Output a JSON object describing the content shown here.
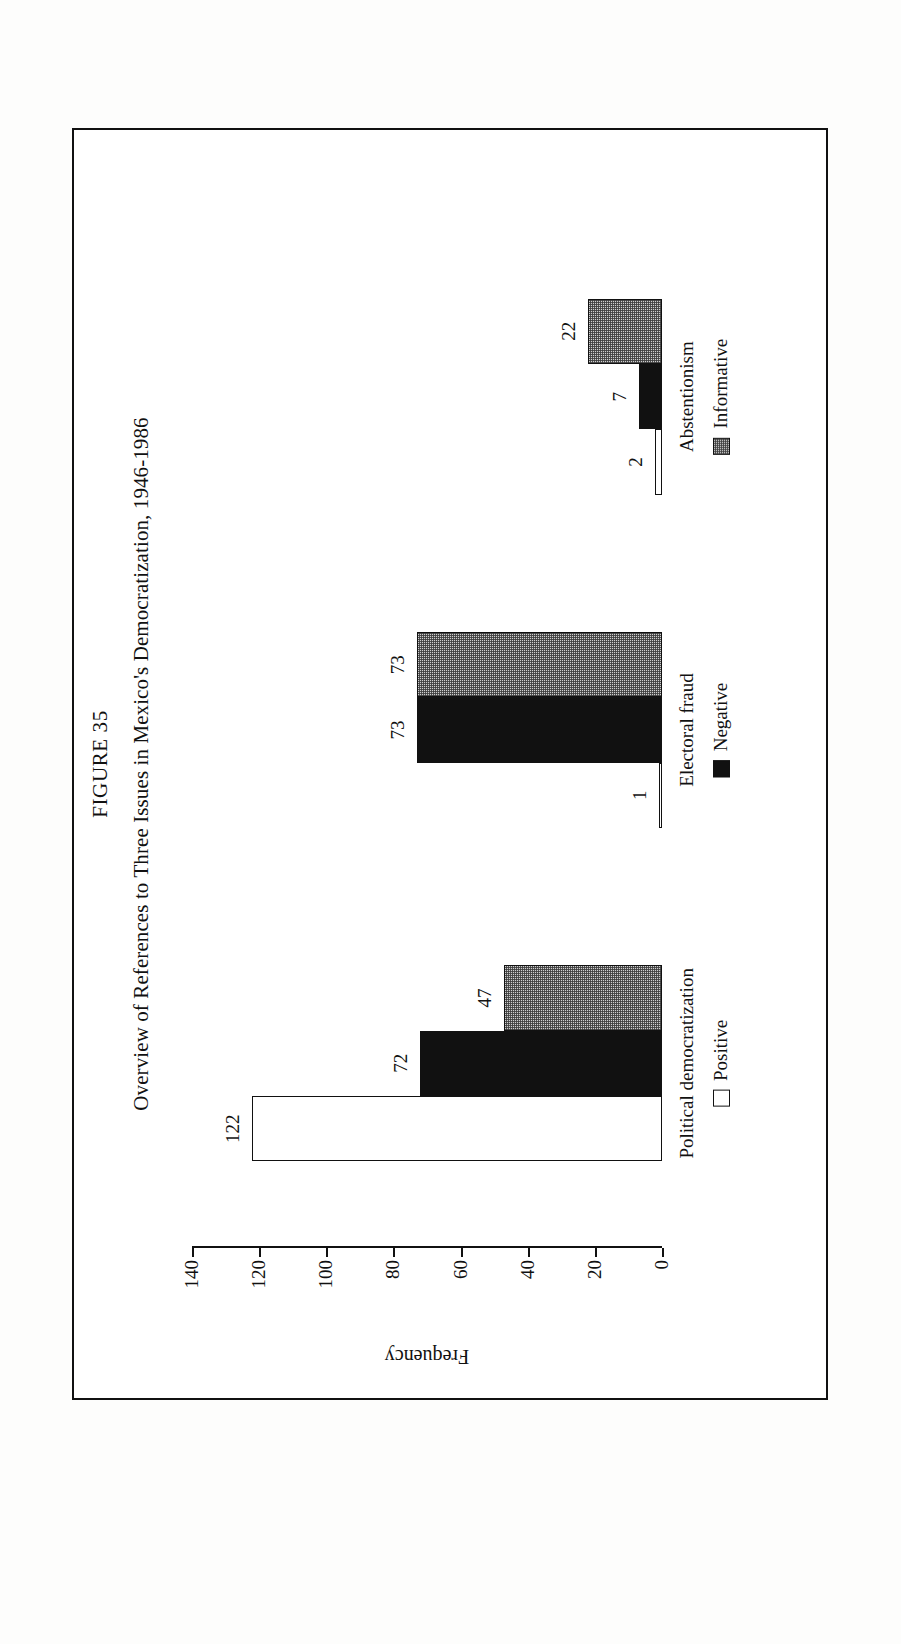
{
  "figure": {
    "number_label": "FIGURE 35",
    "title": "Overview of References to Three Issues in Mexico's Democratization, 1946-1986"
  },
  "legend": {
    "position": "bottom",
    "items": [
      {
        "label": "Positive",
        "swatch": "white-square-outline",
        "color": "#ffffff"
      },
      {
        "label": "Negative",
        "swatch": "black-square",
        "color": "#111111"
      },
      {
        "label": "Informative",
        "swatch": "gray-dotted-square",
        "color": "#cfcfcf"
      }
    ]
  },
  "chart_data": {
    "type": "bar",
    "title": "Overview of References to Three Issues in Mexico's Democratization, 1946-1986",
    "xlabel": "",
    "ylabel": "Frequency",
    "ylim": [
      0,
      140
    ],
    "yticks": [
      140,
      120,
      100,
      80,
      60,
      40,
      20,
      0
    ],
    "ytick_labels": [
      "140",
      "120",
      "100",
      "80",
      "60",
      "40",
      "20",
      "0"
    ],
    "grid": false,
    "orientation": "vertical",
    "categories": [
      "Political democratization",
      "Electoral fraud",
      "Abstentionism"
    ],
    "series": [
      {
        "name": "Positive",
        "values": [
          122,
          1,
          2
        ],
        "color": "#ffffff"
      },
      {
        "name": "Negative",
        "values": [
          72,
          73,
          7
        ],
        "color": "#111111"
      },
      {
        "name": "Informative",
        "values": [
          47,
          73,
          22
        ],
        "color": "#cfcfcf"
      }
    ],
    "data_labels": [
      {
        "series": "Positive",
        "category": "Political democratization",
        "value": "122"
      },
      {
        "series": "Negative",
        "category": "Political democratization",
        "value": "72"
      },
      {
        "series": "Informative",
        "category": "Political democratization",
        "value": "47"
      },
      {
        "series": "Positive",
        "category": "Electoral fraud",
        "value": "1"
      },
      {
        "series": "Negative",
        "category": "Electoral fraud",
        "value": "73"
      },
      {
        "series": "Informative",
        "category": "Electoral fraud",
        "value": "73"
      },
      {
        "series": "Positive",
        "category": "Abstentionism",
        "value": "2"
      },
      {
        "series": "Negative",
        "category": "Abstentionism",
        "value": "7"
      },
      {
        "series": "Informative",
        "category": "Abstentionism",
        "value": "22"
      }
    ]
  }
}
